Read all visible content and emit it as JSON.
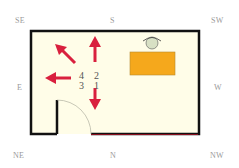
{
  "compass": {
    "se": "SE",
    "s": "S",
    "sw": "SW",
    "e": "E",
    "w": "W",
    "ne": "NE",
    "n": "N",
    "nw": "NW"
  },
  "room": {
    "floor_color": "#fffde8",
    "wall_color": "#111111",
    "bottom_wall_accent": "#8a1020",
    "desk_color": "#f5a81c",
    "chair_color": "#d8e0c4",
    "arrow_color": "#d9203e"
  },
  "sectors": {
    "row1": {
      "left": "4",
      "right": "2"
    },
    "row2": {
      "left": "3",
      "right": "1"
    }
  },
  "arrows": [
    {
      "name": "arrow-up",
      "direction": "S"
    },
    {
      "name": "arrow-up-left",
      "direction": "SE"
    },
    {
      "name": "arrow-left",
      "direction": "E"
    },
    {
      "name": "arrow-down",
      "direction": "N"
    }
  ]
}
